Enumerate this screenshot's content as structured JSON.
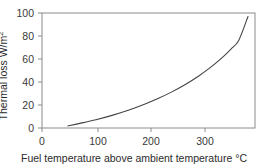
{
  "chart_data": {
    "type": "line",
    "title": "",
    "xlabel": "Fuel temperature above ambient temperature °C",
    "ylabel": "Thermal loss W/m²",
    "ylabel_base": "Thermal loss W/m",
    "ylabel_exponent": "2",
    "xlim": [
      0,
      395
    ],
    "ylim": [
      0,
      100
    ],
    "xticks": [
      0,
      100,
      200,
      300
    ],
    "xtick_labels": [
      "0",
      "100",
      "200",
      "300"
    ],
    "yticks": [
      0,
      20,
      40,
      60,
      80,
      100
    ],
    "ytick_labels": [
      "0",
      "20",
      "40",
      "60",
      "80",
      "100"
    ],
    "grid": false,
    "legend": null,
    "series": [
      {
        "name": "Thermal loss",
        "color": "#444444",
        "x": [
          48,
          70,
          100,
          130,
          160,
          190,
          215,
          240,
          265,
          290,
          310,
          330,
          350,
          365,
          382
        ],
        "y": [
          1.8,
          4.0,
          7.2,
          11.0,
          15.4,
          20.6,
          25.6,
          31.2,
          37.6,
          45.0,
          51.8,
          59.4,
          68.4,
          76.4,
          97.0
        ]
      }
    ]
  },
  "axis": {
    "frame_color": "#8c8c8c",
    "curve_color": "#4a4a4a"
  }
}
